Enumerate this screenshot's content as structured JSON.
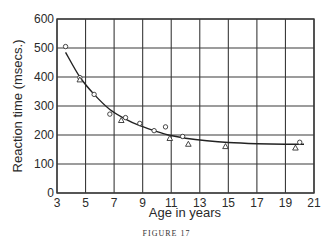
{
  "figure": {
    "caption": "FIGURE 17"
  },
  "chart_data": {
    "type": "scatter",
    "title": "",
    "xlabel": "Age in years",
    "ylabel": "Reaction time (msecs.)",
    "xlim": [
      3,
      21
    ],
    "ylim": [
      0,
      600
    ],
    "x_ticks": [
      3,
      5,
      7,
      9,
      11,
      13,
      15,
      17,
      19,
      21
    ],
    "y_ticks": [
      0,
      100,
      200,
      300,
      400,
      500,
      600
    ],
    "grid": true,
    "legend": null,
    "series": [
      {
        "name": "circles",
        "marker": "circle",
        "points": [
          {
            "x": 3.6,
            "y": 505
          },
          {
            "x": 4.6,
            "y": 398
          },
          {
            "x": 5.6,
            "y": 340
          },
          {
            "x": 6.7,
            "y": 272
          },
          {
            "x": 7.8,
            "y": 260
          },
          {
            "x": 8.8,
            "y": 240
          },
          {
            "x": 9.8,
            "y": 215
          },
          {
            "x": 10.6,
            "y": 228
          },
          {
            "x": 11.8,
            "y": 195
          },
          {
            "x": 20.0,
            "y": 175
          }
        ]
      },
      {
        "name": "triangles",
        "marker": "triangle",
        "points": [
          {
            "x": 4.6,
            "y": 390
          },
          {
            "x": 7.5,
            "y": 250
          },
          {
            "x": 10.9,
            "y": 188
          },
          {
            "x": 12.2,
            "y": 168
          },
          {
            "x": 14.8,
            "y": 160
          },
          {
            "x": 19.7,
            "y": 155
          }
        ]
      },
      {
        "name": "fitted curve",
        "marker": "line",
        "points": [
          {
            "x": 3.6,
            "y": 485
          },
          {
            "x": 4.6,
            "y": 400
          },
          {
            "x": 5.6,
            "y": 340
          },
          {
            "x": 6.7,
            "y": 288
          },
          {
            "x": 7.8,
            "y": 255
          },
          {
            "x": 8.8,
            "y": 232
          },
          {
            "x": 9.8,
            "y": 215
          },
          {
            "x": 10.8,
            "y": 200
          },
          {
            "x": 12.0,
            "y": 189
          },
          {
            "x": 13.5,
            "y": 180
          },
          {
            "x": 15.0,
            "y": 174
          },
          {
            "x": 17.0,
            "y": 170
          },
          {
            "x": 19.0,
            "y": 168
          },
          {
            "x": 20.3,
            "y": 168
          }
        ]
      }
    ]
  }
}
